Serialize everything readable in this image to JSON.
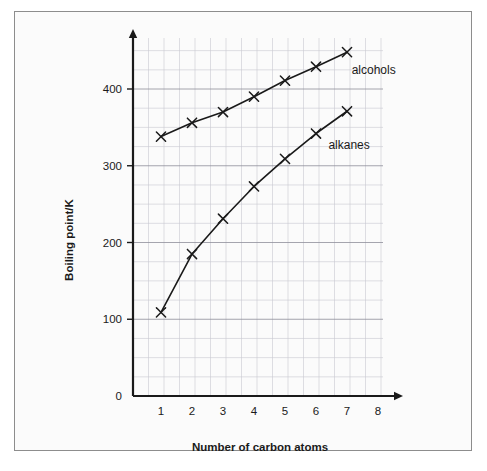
{
  "chart_data": {
    "type": "line",
    "title": "",
    "xlabel": "Number of carbon atoms",
    "ylabel": "Boiling point/K",
    "x": [
      1,
      2,
      3,
      4,
      5,
      6,
      7
    ],
    "xlim": [
      0,
      8
    ],
    "ylim": [
      0,
      465
    ],
    "x_tick_labels": [
      "1",
      "2",
      "3",
      "4",
      "5",
      "6",
      "7",
      "8"
    ],
    "x_tick_values": [
      1,
      2,
      3,
      4,
      5,
      6,
      7,
      8
    ],
    "y_tick_labels": [
      "0",
      "100",
      "200",
      "300",
      "400"
    ],
    "y_tick_values": [
      0,
      100,
      200,
      300,
      400
    ],
    "grid": true,
    "grid_minor": true,
    "grid_minor_step_y": 25,
    "grid_major_step_y": 100,
    "legend_position": "inline-annotation",
    "marker": "x",
    "series": [
      {
        "name": "alcohols",
        "values": [
          338,
          356,
          370,
          390,
          411,
          429,
          448
        ],
        "label_x": 7.15,
        "label_y": 420
      },
      {
        "name": "alkanes",
        "values": [
          109,
          185,
          231,
          273,
          309,
          342,
          371
        ],
        "label_x": 6.4,
        "label_y": 322
      }
    ]
  },
  "axes": {
    "x_axis_title": "Number of carbon atoms",
    "y_axis_title": "Boiling point/K",
    "zero_label": "0"
  },
  "colors": {
    "line": "#1a1a1a",
    "grid_major": "#8f8f9a",
    "grid_minor": "#c9c9d2",
    "axis": "#1a1a1a",
    "frame_border": "#8d8d8d",
    "background": "#fbfbfb",
    "text": "#1a1a1a"
  }
}
